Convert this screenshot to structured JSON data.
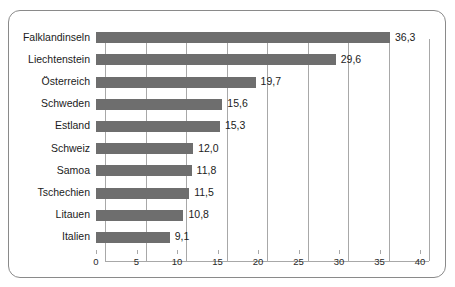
{
  "frame": {
    "border_color": "#8a8a8a",
    "background": "#ffffff"
  },
  "chart_data": {
    "type": "bar",
    "orientation": "horizontal",
    "title": "",
    "subtitle": "",
    "xlabel": "",
    "ylabel": "",
    "categories": [
      "Falklandinseln",
      "Liechtenstein",
      "Österreich",
      "Schweden",
      "Estland",
      "Schweiz",
      "Samoa",
      "Tschechien",
      "Litauen",
      "Italien"
    ],
    "values": [
      36.3,
      29.6,
      19.7,
      15.6,
      15.3,
      12.0,
      11.8,
      11.5,
      10.8,
      9.1
    ],
    "value_labels": [
      "36,3",
      "29,6",
      "19,7",
      "15,6",
      "15,3",
      "12,0",
      "11,8",
      "11,5",
      "10,8",
      "9,1"
    ],
    "xlim": [
      0,
      40
    ],
    "xticks": [
      0,
      5,
      10,
      15,
      20,
      25,
      30,
      35,
      40
    ],
    "xtick_labels": [
      "0",
      "5",
      "10",
      "15",
      "20",
      "25",
      "30",
      "35",
      "40"
    ],
    "grid": true,
    "grid_axis": "x",
    "legend": null,
    "bar_color": "#6e6e6e",
    "grid_color": "#a8a8a8",
    "text_color": "#1b1b1b",
    "decimal_separator": ","
  }
}
